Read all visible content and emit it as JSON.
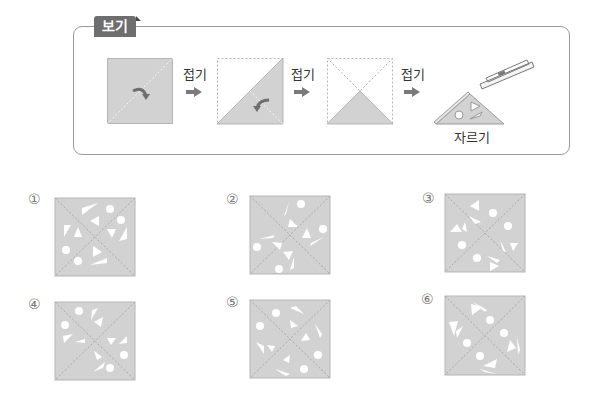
{
  "example": {
    "tag": "보기",
    "steps": [
      {
        "label": "접기"
      },
      {
        "label": "접기"
      },
      {
        "label": "접기"
      },
      {
        "label": "자르기"
      }
    ],
    "colors": {
      "paper": "#d2d2d2",
      "dash": "#a8a8a8",
      "arrow": "#7a7a7a",
      "tag_bg": "#6e6e6e"
    }
  },
  "options": [
    {
      "number": "①"
    },
    {
      "number": "②"
    },
    {
      "number": "③"
    },
    {
      "number": "④"
    },
    {
      "number": "⑤"
    },
    {
      "number": "⑥"
    }
  ]
}
